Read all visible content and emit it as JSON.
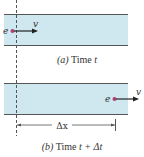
{
  "colors": {
    "wire_fill": "#cfe7ef",
    "wire_border": "#555555",
    "electron": "#b0406a",
    "arrow": "#222222",
    "dashed": "#555555",
    "text": "#333333"
  },
  "panel_a": {
    "electron_label": "e",
    "velocity_label": "v",
    "caption_letter": "(a)",
    "caption_text": "Time",
    "caption_var": "t"
  },
  "panel_b": {
    "electron_label": "e",
    "velocity_label": "v",
    "displacement_label": "Δx",
    "caption_letter": "(b)",
    "caption_text": "Time",
    "caption_var": "t + Δt"
  }
}
